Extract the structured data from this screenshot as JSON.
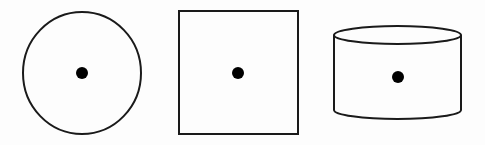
{
  "diagram": {
    "background": "#fdfdfd",
    "stroke_color": "#1a1a1a",
    "dot_color": "#000000",
    "shapes": [
      {
        "kind": "circle",
        "label": "circle",
        "cx": 82,
        "cy": 73,
        "rx": 59,
        "ry": 61,
        "center_dot": {
          "cx": 82,
          "cy": 73,
          "r": 6
        }
      },
      {
        "kind": "square",
        "label": "square",
        "x": 179,
        "y": 11,
        "width": 119,
        "height": 123,
        "center_dot": {
          "cx": 238,
          "cy": 73,
          "r": 6
        }
      },
      {
        "kind": "cylinder",
        "label": "cylinder",
        "left": 334,
        "right": 461,
        "top_cy": 35,
        "ry": 9,
        "bottom_cy": 110,
        "center_dot": {
          "cx": 398,
          "cy": 77,
          "r": 6
        }
      }
    ]
  }
}
